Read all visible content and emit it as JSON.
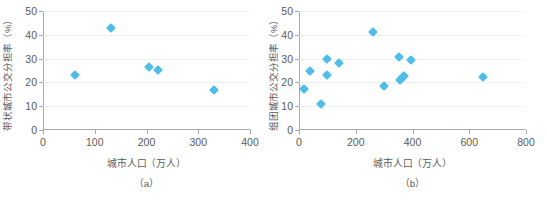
{
  "figure": {
    "panels": [
      {
        "key": "a",
        "caption": "（a）",
        "xlabel": "城市人口（万人）",
        "ylabel": "带状城市公交分担率（%）",
        "xticks": [
          "0",
          "100",
          "200",
          "300",
          "400"
        ],
        "yticks": [
          "0",
          "10",
          "20",
          "30",
          "40",
          "50"
        ]
      },
      {
        "key": "b",
        "caption": "（b）",
        "xlabel": "城市人口（万人）",
        "ylabel": "组团城市公交分担率（%）",
        "xticks": [
          "0",
          "200",
          "400",
          "600",
          "800"
        ],
        "yticks": [
          "0",
          "10",
          "20",
          "30",
          "40",
          "50"
        ]
      }
    ]
  },
  "chart_data": [
    {
      "type": "scatter",
      "title": "（a）",
      "xlabel": "城市人口（万人）",
      "ylabel": "带状城市公交分担率（%）",
      "xlim": [
        0,
        400
      ],
      "ylim": [
        0,
        50
      ],
      "xticks": [
        0,
        100,
        200,
        300,
        400
      ],
      "yticks": [
        0,
        10,
        20,
        30,
        40,
        50
      ],
      "grid": "horizontal",
      "legend": "none",
      "marker": "diamond",
      "color": "#4fbde8",
      "points": [
        {
          "x": 62,
          "y": 23.2
        },
        {
          "x": 131,
          "y": 43.0
        },
        {
          "x": 205,
          "y": 26.6
        },
        {
          "x": 222,
          "y": 25.2
        },
        {
          "x": 330,
          "y": 16.8
        }
      ]
    },
    {
      "type": "scatter",
      "title": "（b）",
      "xlabel": "城市人口（万人）",
      "ylabel": "组团城市公交分担率（%）",
      "xlim": [
        0,
        800
      ],
      "ylim": [
        0,
        50
      ],
      "xticks": [
        0,
        200,
        400,
        600,
        800
      ],
      "yticks": [
        0,
        10,
        20,
        30,
        40,
        50
      ],
      "grid": "horizontal",
      "legend": "none",
      "marker": "diamond",
      "color": "#4fbde8",
      "points": [
        {
          "x": 18,
          "y": 17.4
        },
        {
          "x": 40,
          "y": 24.6
        },
        {
          "x": 78,
          "y": 11.0
        },
        {
          "x": 98,
          "y": 30.0
        },
        {
          "x": 100,
          "y": 23.3
        },
        {
          "x": 141,
          "y": 28.2
        },
        {
          "x": 260,
          "y": 41.3
        },
        {
          "x": 299,
          "y": 18.4
        },
        {
          "x": 352,
          "y": 30.5
        },
        {
          "x": 355,
          "y": 21.0
        },
        {
          "x": 366,
          "y": 22.2
        },
        {
          "x": 371,
          "y": 22.5
        },
        {
          "x": 393,
          "y": 29.5
        },
        {
          "x": 648,
          "y": 22.4
        }
      ]
    }
  ]
}
